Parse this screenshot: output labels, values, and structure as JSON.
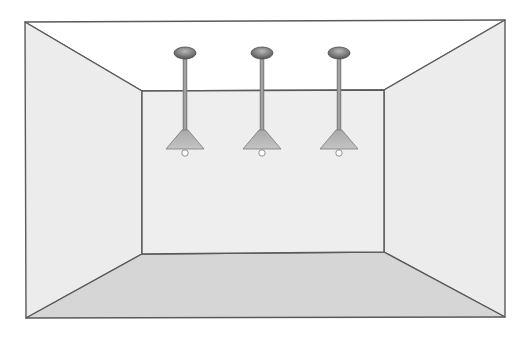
{
  "diagram": {
    "type": "room-perspective",
    "canvas": {
      "width": 526,
      "height": 344,
      "background": "#ffffff"
    },
    "colors": {
      "stroke": "#5a5a5a",
      "ceiling": "#ffffff",
      "wall": "#ececec",
      "back_wall": "#eeeeee",
      "floor": "#d6d6d6",
      "canopy_dark": "#5e5e5e",
      "canopy_light": "#b0b0b0",
      "rod": "#8c8c8c",
      "shade": "#b9b9b9",
      "bulb": "#ffffff"
    },
    "outer_frame": {
      "tl": [
        25,
        22
      ],
      "tr": [
        505,
        20
      ],
      "br": [
        505,
        317
      ],
      "bl": [
        26,
        318
      ]
    },
    "back_wall": {
      "tl": [
        142,
        91
      ],
      "tr": [
        384,
        90
      ],
      "br": [
        384,
        252
      ],
      "bl": [
        142,
        254
      ]
    },
    "surfaces": [
      {
        "name": "ceiling",
        "label": "Ceiling"
      },
      {
        "name": "left-wall",
        "label": "Left wall"
      },
      {
        "name": "back-wall",
        "label": "Back wall"
      },
      {
        "name": "right-wall",
        "label": "Right wall"
      },
      {
        "name": "floor",
        "label": "Floor"
      }
    ],
    "lamps": [
      {
        "name": "lamp-1",
        "cx": 185,
        "canopy_y": 53,
        "shade_top": 130,
        "shade_bottom": 149,
        "bulb_y": 153
      },
      {
        "name": "lamp-2",
        "cx": 262,
        "canopy_y": 53,
        "shade_top": 130,
        "shade_bottom": 149,
        "bulb_y": 153
      },
      {
        "name": "lamp-3",
        "cx": 339,
        "canopy_y": 53,
        "shade_top": 130,
        "shade_bottom": 149,
        "bulb_y": 153
      }
    ]
  }
}
